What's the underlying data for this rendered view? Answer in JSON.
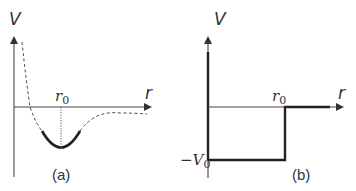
{
  "panels": [
    {
      "id": "a",
      "caption": "(a)",
      "y_axis_label": "V",
      "x_axis_label": "r",
      "marker_label_main": "r",
      "marker_label_sub": "0",
      "description": "Realistic interatomic potential with minimum at r0; harmonic (parabolic) approximation near minimum shown solid"
    },
    {
      "id": "b",
      "caption": "(b)",
      "y_axis_label": "V",
      "x_axis_label": "r",
      "marker_label_main": "r",
      "marker_label_sub": "0",
      "depth_label_prefix": "−V",
      "depth_label_sub": "0",
      "description": "Square-well potential of depth -V0 and width r0"
    }
  ],
  "colors": {
    "axis": "#555555",
    "curve": "#222222",
    "text": "#333333"
  }
}
